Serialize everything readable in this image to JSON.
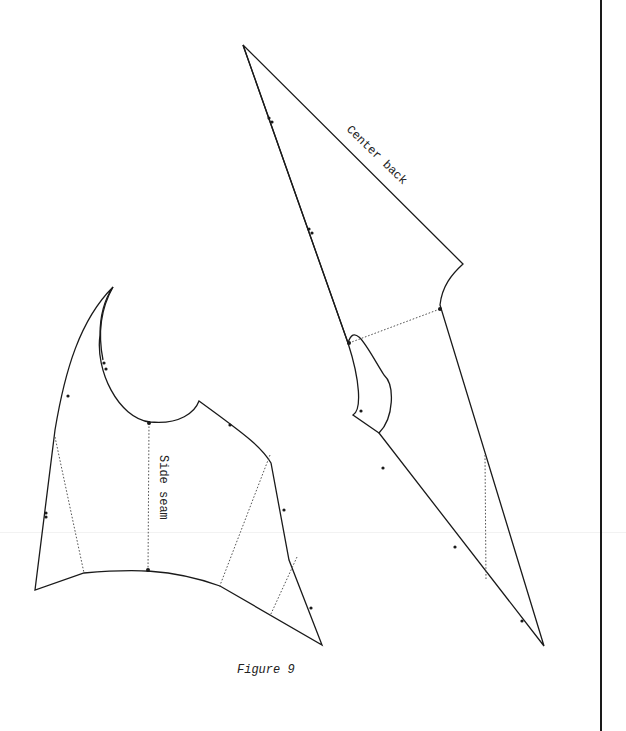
{
  "figure": {
    "caption": "Figure 9",
    "pieces": [
      {
        "id": "back-piece",
        "label": "Center back",
        "label_rotation_deg": 44
      },
      {
        "id": "side-piece",
        "label": "Side seam",
        "label_rotation_deg": 90
      }
    ]
  },
  "colors": {
    "line": "#1a1a1a",
    "guide": "#555555",
    "background": "#ffffff"
  }
}
